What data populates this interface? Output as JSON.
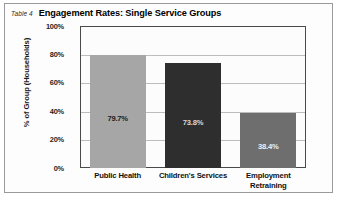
{
  "figure": {
    "table_number": "Table 4",
    "title": "Engagement Rates: Single Service Groups"
  },
  "chart_data": {
    "type": "bar",
    "title": "Engagement Rates: Single Service Groups",
    "xlabel": "",
    "ylabel": "% of Group (Households)",
    "categories": [
      "Public Health",
      "Children's Services",
      "Employment Retraining"
    ],
    "values": [
      79.7,
      73.8,
      38.4
    ],
    "value_labels": [
      "79.7%",
      "73.8%",
      "38.4%"
    ],
    "ylim": [
      0,
      100
    ],
    "yticks": [
      0,
      20,
      40,
      60,
      80,
      100
    ],
    "ytick_labels": [
      "0%",
      "20%",
      "40%",
      "60%",
      "80%",
      "100%"
    ],
    "grid": true,
    "legend": "none",
    "bar_colors": [
      "#a6a6a6",
      "#2e2e2e",
      "#6e6e6e"
    ],
    "label_colors": [
      "#1a1a1a",
      "#d8d8d8",
      "#f0f0f0"
    ]
  },
  "axis": {
    "y_title": "% of Group (Households)"
  }
}
